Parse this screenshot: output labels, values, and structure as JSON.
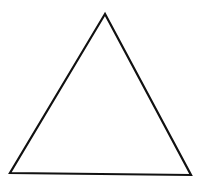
{
  "diagram": {
    "shape": "triangle",
    "vertices": {
      "apex": [
        105,
        14
      ],
      "bottom_left": [
        10,
        173
      ],
      "bottom_right": [
        191,
        175
      ]
    },
    "stroke_color": "#111111",
    "stroke_width": 2.2,
    "fill_color": "#ffffff",
    "background_color": "#ffffff"
  }
}
